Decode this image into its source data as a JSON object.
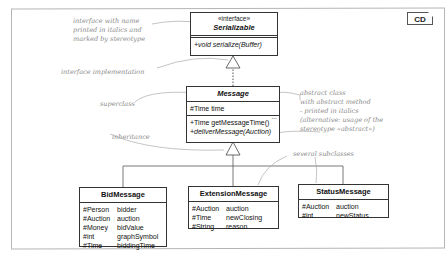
{
  "diagram": {
    "tag": "CD",
    "classes": {
      "serializable": {
        "stereotype": "«interface»",
        "name": "Serializable",
        "operations": [
          "+void serialize(Buffer)"
        ]
      },
      "message": {
        "name": "Message",
        "attributes": [
          "#Time time"
        ],
        "more_indicator": "...",
        "operations": [
          "+Time getMessageTime()",
          "+deliverMessage(Auction)"
        ]
      },
      "bid_message": {
        "name": "BidMessage",
        "attributes": [
          {
            "type": "#Person",
            "name": "bidder"
          },
          {
            "type": "#Auction",
            "name": "auction"
          },
          {
            "type": "#Money",
            "name": "bidValue"
          },
          {
            "type": "#int",
            "name": "graphSymbol"
          },
          {
            "type": "#Time",
            "name": "biddingTime"
          }
        ]
      },
      "extension_message": {
        "name": "ExtensionMessage",
        "attributes": [
          {
            "type": "#Auction",
            "name": "auction"
          },
          {
            "type": "#Time",
            "name": "newClosing"
          },
          {
            "type": "#String",
            "name": "reason"
          }
        ]
      },
      "status_message": {
        "name": "StatusMessage",
        "attributes": [
          {
            "type": "#Auction",
            "name": "auction"
          },
          {
            "type": "#int",
            "name": "newStatus"
          }
        ]
      }
    },
    "annotations": {
      "interface_note": [
        "interface with name",
        "printed in italics and",
        "marked by stereotype"
      ],
      "implementation_note": "interface implementation",
      "superclass_note": "superclass",
      "inheritance_note": "inheritance",
      "abstract_note": [
        "abstract class",
        "with abstract method",
        "- printed in italics",
        "(alternative: usage of the",
        "stereotype «abstract»)"
      ],
      "subclasses_note": "several subclasses"
    }
  }
}
